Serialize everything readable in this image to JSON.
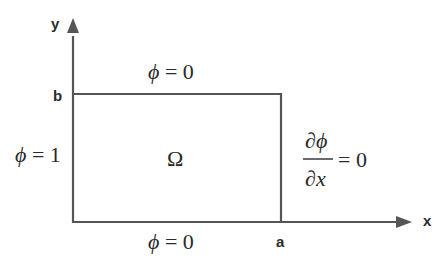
{
  "diagram": {
    "axes": {
      "x_label": "x",
      "y_label": "y"
    },
    "ticks": {
      "a": "a",
      "b": "b"
    },
    "domain_label": "Ω",
    "boundary_conditions": {
      "top": {
        "symbol": "ϕ",
        "rest": " = 0"
      },
      "bottom": {
        "symbol": "ϕ",
        "rest": " = 0"
      },
      "left": {
        "symbol": "ϕ",
        "rest": " = 1"
      },
      "right": {
        "numerator_partial": "∂",
        "numerator_symbol": "ϕ",
        "denominator_partial": "∂",
        "denominator_symbol": "x",
        "rest": "= 0"
      }
    },
    "colors": {
      "line": "#555555",
      "text": "#2a2a2a"
    }
  }
}
